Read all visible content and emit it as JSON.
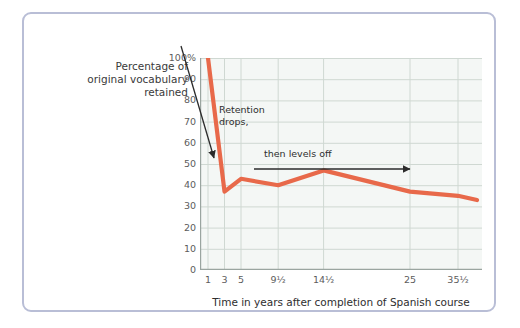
{
  "chart_data": {
    "type": "line",
    "title": "",
    "xlabel": "Time in years after completion of Spanish course",
    "ylabel": "Percentage of original vocabulary retained",
    "ylim": [
      0,
      100
    ],
    "grid": true,
    "legend": null,
    "line_color": "#e8694a",
    "x_tick_labels": [
      "1",
      "3",
      "5",
      "9½",
      "14½",
      "25",
      "35½",
      "49½"
    ],
    "y_tick_labels": [
      "0",
      "10",
      "20",
      "30",
      "40",
      "50",
      "60",
      "70",
      "80",
      "90",
      "100%"
    ],
    "y_ticks": [
      0,
      10,
      20,
      30,
      40,
      50,
      60,
      70,
      80,
      90,
      100
    ],
    "x": [
      "1",
      "3",
      "5",
      "9½",
      "14½",
      "25",
      "35½",
      "49½"
    ],
    "values": [
      100,
      37,
      43,
      40,
      47,
      37,
      35,
      33
    ],
    "series": [
      {
        "name": "Percentage of original vocabulary retained",
        "values": [
          100,
          37,
          43,
          40,
          47,
          37,
          35,
          33
        ]
      }
    ],
    "annotations": [
      {
        "text": "Retention drops,",
        "line1": "Retention",
        "line2": "drops,"
      },
      {
        "text": "then levels off"
      }
    ]
  },
  "axis": {
    "y_title_line1": "Percentage of",
    "y_title_line2": "original vocabulary",
    "y_title_line3": "retained",
    "x_title": "Time in years after completion of Spanish course"
  },
  "annotations": {
    "drop_line1": "Retention",
    "drop_line2": "drops,",
    "level_off": "then levels off"
  },
  "colors": {
    "line": "#e8694a",
    "frame_border": "#b9bed6",
    "grid": "#cfd8d2",
    "plot_background": "#f4f7f5",
    "annotation_arrow": "#2b2b2b",
    "tick_text": "#5c5c5c"
  }
}
